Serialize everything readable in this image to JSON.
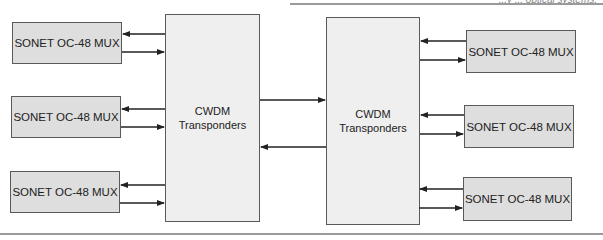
{
  "caption": "...y ... optical systems.",
  "colors": {
    "mux_fill": "#dedede",
    "cwdm_fill": "#efefef",
    "border": "#5a5a5a",
    "line": "#222222"
  },
  "left_muxes": [
    {
      "label": "SONET OC-48 MUX"
    },
    {
      "label": "SONET OC-48 MUX"
    },
    {
      "label": "SONET OC-48 MUX"
    }
  ],
  "right_muxes": [
    {
      "label": "SONET OC-48 MUX"
    },
    {
      "label": "SONET OC-48 MUX"
    },
    {
      "label": "SONET OC-48 MUX"
    }
  ],
  "left_cwdm": {
    "line1": "CWDM",
    "line2": "Transponders"
  },
  "right_cwdm": {
    "line1": "CWDM",
    "line2": "Transponders"
  },
  "links": {
    "left_mux_to_cwdm": "bidirectional (2 arrows each)",
    "cwdm_to_cwdm": "bidirectional (2 arrows)",
    "right_mux_to_cwdm": "bidirectional (2 arrows each)"
  }
}
